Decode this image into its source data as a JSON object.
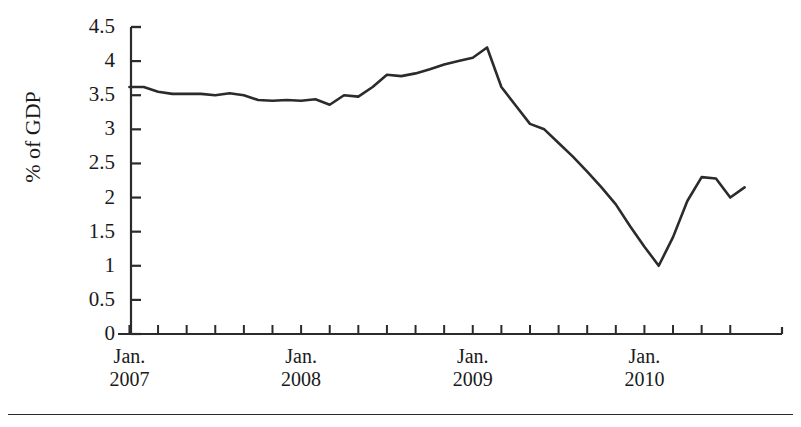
{
  "chart_data": {
    "type": "line",
    "title": "",
    "subtitle": "",
    "xlabel": "",
    "ylabel": "% of GDP",
    "ylim": [
      0,
      4.5
    ],
    "ytick_step": 0.5,
    "ytick_labels": [
      "4.5",
      "4",
      "3.5",
      "3",
      "2.5",
      "2",
      "1.5",
      "1",
      "0.5",
      "0"
    ],
    "ytick_values": [
      4.5,
      4,
      3.5,
      3,
      2.5,
      2,
      1.5,
      1,
      0.5,
      0
    ],
    "xtick_labels": [
      {
        "month": "Jan.",
        "year": "2007"
      },
      {
        "month": "Jan.",
        "year": "2008"
      },
      {
        "month": "Jan.",
        "year": "2009"
      },
      {
        "month": "Jan.",
        "year": "2010"
      }
    ],
    "x_minor_ticks_every_months": 2,
    "grid": false,
    "legend": null,
    "line_color": "#2b2b2b",
    "x": [
      "2007-01",
      "2007-02",
      "2007-03",
      "2007-04",
      "2007-05",
      "2007-06",
      "2007-07",
      "2007-08",
      "2007-09",
      "2007-10",
      "2007-11",
      "2007-12",
      "2008-01",
      "2008-02",
      "2008-03",
      "2008-04",
      "2008-05",
      "2008-06",
      "2008-07",
      "2008-08",
      "2008-09",
      "2008-10",
      "2008-11",
      "2008-12",
      "2009-01",
      "2009-02",
      "2009-03",
      "2009-04",
      "2009-05",
      "2009-06",
      "2009-07",
      "2009-08",
      "2009-09",
      "2009-10",
      "2009-11",
      "2009-12",
      "2010-01",
      "2010-02",
      "2010-03",
      "2010-04",
      "2010-05",
      "2010-06"
    ],
    "values": [
      3.62,
      3.62,
      3.55,
      3.52,
      3.52,
      3.52,
      3.5,
      3.53,
      3.5,
      3.43,
      3.42,
      3.43,
      3.42,
      3.44,
      3.36,
      3.5,
      3.48,
      3.62,
      3.8,
      3.78,
      3.82,
      3.88,
      3.95,
      4.0,
      4.05,
      4.2,
      3.62,
      3.35,
      3.08,
      3.0,
      2.8,
      2.6,
      2.38,
      2.15,
      1.9,
      1.58,
      1.28,
      1.0,
      1.42,
      1.95,
      2.3,
      2.28
    ],
    "values_tail": [
      2.0,
      2.15
    ],
    "series_name": "Budget balance (% of GDP)",
    "max_value": 4.2,
    "min_value": 1.0,
    "start_value": 3.62,
    "end_value": 2.15
  },
  "axes": {
    "y_axis_name": "y-axis",
    "x_axis_name": "x-axis"
  }
}
